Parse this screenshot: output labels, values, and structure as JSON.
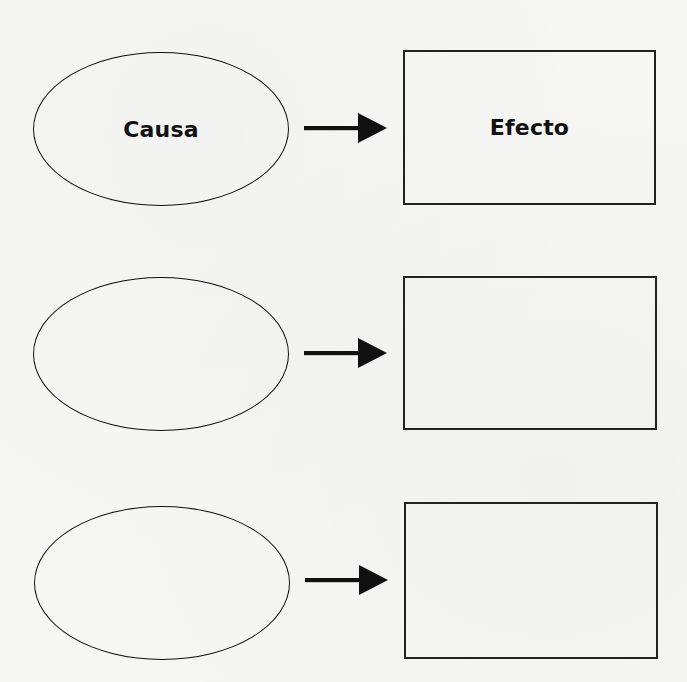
{
  "diagram": {
    "type": "cause-effect-organizer",
    "colors": {
      "background": "#f6f6f5",
      "stroke": "#111111",
      "text": "#111111"
    },
    "rows": [
      {
        "cause": {
          "shape": "ellipse",
          "label": "Causa"
        },
        "connector": {
          "icon": "arrow-right-icon"
        },
        "effect": {
          "shape": "rectangle",
          "label": "Efecto"
        }
      },
      {
        "cause": {
          "shape": "ellipse",
          "label": ""
        },
        "connector": {
          "icon": "arrow-right-icon"
        },
        "effect": {
          "shape": "rectangle",
          "label": ""
        }
      },
      {
        "cause": {
          "shape": "ellipse",
          "label": ""
        },
        "connector": {
          "icon": "arrow-right-icon"
        },
        "effect": {
          "shape": "rectangle",
          "label": ""
        }
      }
    ]
  }
}
